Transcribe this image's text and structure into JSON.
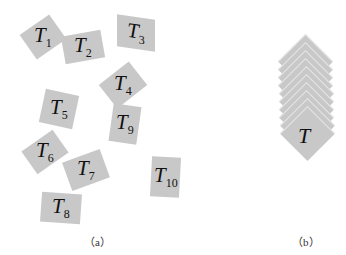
{
  "figure": {
    "panel_a": {
      "caption": "（a）",
      "tiles": [
        {
          "name": "T",
          "sub": "1"
        },
        {
          "name": "T",
          "sub": "2"
        },
        {
          "name": "T",
          "sub": "3"
        },
        {
          "name": "T",
          "sub": "4"
        },
        {
          "name": "T",
          "sub": "5"
        },
        {
          "name": "T",
          "sub": "6"
        },
        {
          "name": "T",
          "sub": "7"
        },
        {
          "name": "T",
          "sub": "8"
        },
        {
          "name": "T",
          "sub": "9"
        },
        {
          "name": "T",
          "sub": "10"
        }
      ]
    },
    "panel_b": {
      "caption": "（b）",
      "stack_label": "T",
      "stack_count": 10
    },
    "colors": {
      "tile": "#c8c8c8",
      "text": "#111111"
    }
  }
}
